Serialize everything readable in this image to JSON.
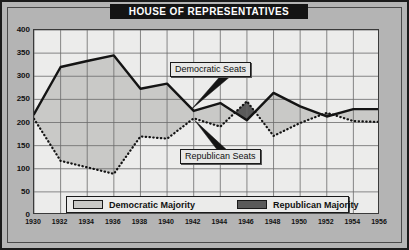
{
  "title": "HOUSE OF REPRESENTATIVES",
  "colors": {
    "banner_bg": "#141414",
    "banner_text": "#ffffff",
    "page_bg": "#b4b4b4",
    "plot_bg": "#ececeb",
    "democratic_majority_fill": "#c9c9c7",
    "republican_majority_fill": "#5a5a5a",
    "line": "#141414",
    "grid": "#6b6b6b"
  },
  "annotations": [
    {
      "name": "democratic-seats",
      "label": "Democratic Seats"
    },
    {
      "name": "republican-seats",
      "label": "Republican Seats"
    }
  ],
  "legend": {
    "position": "inside-bottom-center",
    "items": [
      {
        "name": "democratic-majority",
        "label": "Democratic Majority",
        "swatch": "dem"
      },
      {
        "name": "republican-majority",
        "label": "Republican Majority",
        "swatch": "rep"
      }
    ]
  },
  "chart_data": {
    "type": "line",
    "title": "HOUSE OF REPRESENTATIVES",
    "subtitle": "",
    "xlabel": "",
    "ylabel": "",
    "x": [
      1930,
      1932,
      1934,
      1936,
      1938,
      1940,
      1942,
      1944,
      1946,
      1948,
      1950,
      1952,
      1954,
      1956
    ],
    "xlim": [
      1930,
      1956
    ],
    "ylim": [
      0,
      400
    ],
    "yticks": [
      0,
      50,
      100,
      150,
      200,
      250,
      300,
      350,
      400
    ],
    "xticks": [
      1930,
      1932,
      1934,
      1936,
      1938,
      1940,
      1942,
      1944,
      1946,
      1948,
      1950,
      1952,
      1954,
      1956
    ],
    "grid": true,
    "legend_position": "inside-bottom-center",
    "series": [
      {
        "name": "Democratic Seats",
        "style": "solid",
        "values": [
          218,
          320,
          333,
          345,
          273,
          284,
          225,
          242,
          205,
          264,
          235,
          213,
          229,
          229
        ]
      },
      {
        "name": "Republican Seats",
        "style": "dotted",
        "values": [
          208,
          117,
          103,
          89,
          170,
          165,
          209,
          191,
          246,
          171,
          199,
          221,
          203,
          201
        ]
      }
    ],
    "shaded_regions": [
      {
        "name": "Democratic Majority",
        "fill": "#c9c9c7",
        "description": "area between the two series where Democratic seats exceed Republican seats"
      },
      {
        "name": "Republican Majority",
        "fill": "#5a5a5a",
        "description": "area around 1946 where Republican seats exceed Democratic seats"
      }
    ]
  }
}
